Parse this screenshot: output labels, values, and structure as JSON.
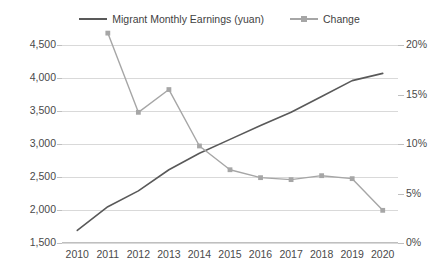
{
  "chart_data": {
    "type": "line",
    "title": "",
    "subtitle": "",
    "xlabel": "",
    "ylabel": "",
    "categories": [
      "2010",
      "2011",
      "2012",
      "2013",
      "2014",
      "2015",
      "2016",
      "2017",
      "2018",
      "2019",
      "2020"
    ],
    "grid": true,
    "legend_position": "top-center",
    "axes": {
      "left": {
        "label": "",
        "ylim": [
          1500,
          4500
        ],
        "ticks": [
          1500,
          2000,
          2500,
          3000,
          3500,
          4000,
          4500
        ],
        "tick_labels": [
          "1,500",
          "2,000",
          "2,500",
          "3,000",
          "3,500",
          "4,000",
          "4,500"
        ]
      },
      "right": {
        "label": "",
        "ylim": [
          0,
          20
        ],
        "ticks": [
          0,
          5,
          10,
          15,
          20
        ],
        "tick_labels": [
          "0%",
          "5%",
          "10%",
          "15%",
          "20%"
        ]
      }
    },
    "series": [
      {
        "name": "Migrant Monthly Earnings (yuan)",
        "axis": "left",
        "color": "#595959",
        "marker": "none",
        "x": [
          "2010",
          "2011",
          "2012",
          "2013",
          "2014",
          "2015",
          "2016",
          "2017",
          "2018",
          "2019",
          "2020"
        ],
        "values": [
          1690,
          2050,
          2290,
          2610,
          2860,
          3070,
          3280,
          3480,
          3720,
          3960,
          4070
        ]
      },
      {
        "name": "Change",
        "axis": "right",
        "color": "#a6a6a6",
        "marker": "square",
        "x": [
          "2011",
          "2012",
          "2013",
          "2014",
          "2015",
          "2016",
          "2017",
          "2018",
          "2019",
          "2020"
        ],
        "values": [
          21.2,
          13.2,
          15.5,
          9.8,
          7.4,
          6.6,
          6.4,
          6.8,
          6.5,
          3.3
        ]
      }
    ]
  },
  "legend": {
    "items": [
      {
        "label": "Migrant Monthly Earnings (yuan)",
        "color": "#595959",
        "marker": "none"
      },
      {
        "label": "Change",
        "color": "#a6a6a6",
        "marker": "square"
      }
    ]
  },
  "colors": {
    "earnings_line": "#595959",
    "change_line": "#a6a6a6",
    "gridline": "#d9d9d9",
    "text": "#4a4a4a",
    "background": "#ffffff"
  }
}
